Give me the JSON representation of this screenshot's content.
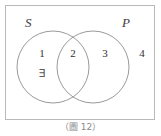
{
  "figure": {
    "caption": "（圖 12）",
    "universe_border_color": "#b9b9b9",
    "circle_stroke_color": "#9a9a9a",
    "background_color": "#ffffff"
  },
  "sets": {
    "subject": {
      "label": "S",
      "name": "subject-set-circle"
    },
    "predicate": {
      "label": "P",
      "name": "predicate-set-circle"
    }
  },
  "regions": [
    {
      "id": "region-1",
      "label": "1",
      "description": "S only"
    },
    {
      "id": "region-2",
      "label": "2",
      "description": "S and P intersection"
    },
    {
      "id": "region-3",
      "label": "3",
      "description": "P only"
    },
    {
      "id": "region-4",
      "label": "4",
      "description": "outside both sets"
    }
  ],
  "markers": {
    "exists_symbol": "∃",
    "exists_region": "region-1"
  }
}
